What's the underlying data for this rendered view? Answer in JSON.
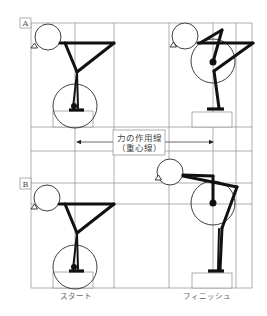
{
  "figure": {
    "panels": [
      {
        "tag": "A",
        "description": "pose pair A (start / finish)"
      },
      {
        "tag": "B",
        "description": "pose pair B (start / finish)"
      }
    ],
    "annotation": {
      "line1": "力の作用線",
      "line2": "（重心線）",
      "arrow": "double-headed horizontal arrow spanning between the two vertical action lines"
    },
    "captions": {
      "start": "スタート",
      "finish": "フィニッシュ"
    },
    "colors": {
      "figure_stroke": "#111111",
      "grid": "#8c8c8c",
      "background": "#ffffff"
    }
  }
}
